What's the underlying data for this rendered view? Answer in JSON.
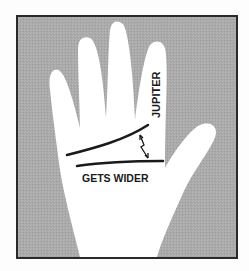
{
  "figure": {
    "labels": {
      "mount": "JUPITER",
      "annotation": "GETS WIDER"
    },
    "colors": {
      "background": "#a9a9a9",
      "frame": "#2a2a2a",
      "hand": "#ffffff",
      "ink": "#1a1a1a"
    }
  }
}
